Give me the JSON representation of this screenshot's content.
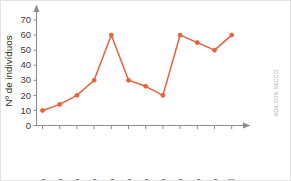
{
  "credit": {
    "text": "ADILSON SECCO"
  },
  "chart_data": {
    "type": "line",
    "title": "",
    "subtitle": "",
    "xlabel": "",
    "ylabel": "Nº de indivíduos",
    "categories": [
      "maio",
      "junho",
      "julho",
      "agosto",
      "setembro",
      "outubro",
      "novembro",
      "dezembro",
      "janeiro",
      "fevereiro",
      "março",
      "abril"
    ],
    "values": [
      10,
      14,
      20,
      30,
      60,
      30,
      26,
      20,
      60,
      55,
      50,
      60
    ],
    "series": [
      {
        "name": "Nº de indivíduos",
        "values": [
          10,
          14,
          20,
          30,
          60,
          30,
          26,
          20,
          60,
          55,
          50,
          60
        ]
      }
    ],
    "ylim": [
      0,
      78
    ],
    "yticks": [
      0,
      10,
      20,
      30,
      40,
      50,
      60,
      70
    ],
    "ytick_labels": [
      "0",
      "10",
      "20",
      "30",
      "40",
      "50",
      "60",
      "70"
    ],
    "grid": false,
    "legend": false,
    "legend_position": "none",
    "line_color": "#e8603c",
    "marker_color": "#e8603c",
    "axis_color": "#8d8d8d",
    "background_color": "#ffffff",
    "annotations": []
  }
}
